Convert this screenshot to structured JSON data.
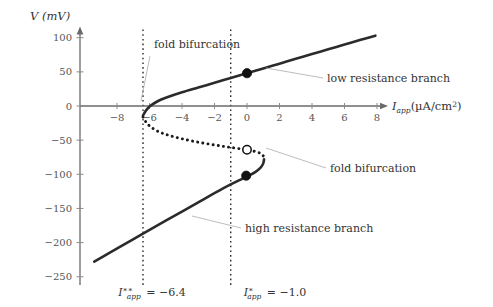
{
  "figure": {
    "kind": "bifurcation-diagram",
    "background": "#ffffff"
  },
  "axes": {
    "y_axis_title": "V (mV)",
    "x_axis_title_main": "I",
    "x_axis_title_sub": "app",
    "x_axis_title_units": "(µA/cm",
    "x_axis_title_units_sup": "2",
    "x_axis_title_units_close": ")",
    "x_ticks": [
      -8,
      -6,
      -4,
      -2,
      0,
      2,
      4,
      6,
      8
    ],
    "x_tick_labels": [
      "−8",
      "−6",
      "−4",
      "−2",
      "0",
      "2",
      "4",
      "6",
      "8"
    ],
    "y_ticks": [
      100,
      50,
      0,
      -50,
      -100,
      -150,
      -200,
      -250
    ],
    "y_tick_labels": [
      "100",
      "50",
      "0",
      "−50",
      "−100",
      "−150",
      "−200",
      "−250"
    ],
    "xlim": [
      -10.2,
      8.9
    ],
    "ylim": [
      -262,
      112
    ],
    "axis_color": "#555555",
    "grid": false
  },
  "annotations": [
    {
      "id": "fold-upper",
      "text": "fold bifurcation",
      "x_px": 154,
      "y_px": 48,
      "leader": [
        [
          150,
          56
        ],
        [
          141,
          101
        ]
      ]
    },
    {
      "id": "low-branch",
      "text": "low resistance branch",
      "x_px": 327,
      "y_px": 82,
      "leader": [
        [
          323,
          78
        ],
        [
          266,
          68
        ]
      ]
    },
    {
      "id": "fold-lower",
      "text": "fold bifurcation",
      "x_px": 330,
      "y_px": 172,
      "leader": [
        [
          326,
          168
        ],
        [
          266,
          148
        ]
      ]
    },
    {
      "id": "high-branch",
      "text": "high resistance branch",
      "x_px": 245,
      "y_px": 232,
      "leader": [
        [
          241,
          228
        ],
        [
          192,
          216
        ]
      ]
    }
  ],
  "parameters": [
    {
      "id": "I-double-star",
      "symbol": "I",
      "sub": "app",
      "sup": "∗∗",
      "equals": "=",
      "value": "−6.4",
      "x_value": -6.4,
      "label_x_px": 152,
      "label_y_px": 296
    },
    {
      "id": "I-star",
      "symbol": "I",
      "sub": "app",
      "sup": "∗",
      "equals": "=",
      "value": "−1.0",
      "x_value": -1.0,
      "label_x_px": 275,
      "label_y_px": 296
    }
  ],
  "chart_data": {
    "type": "line",
    "title": "",
    "xlabel": "I_app (µA/cm^2)",
    "ylabel": "V (mV)",
    "xlim": [
      -10.2,
      8.9
    ],
    "ylim": [
      -262,
      112
    ],
    "grid": false,
    "series": [
      {
        "name": "low resistance branch",
        "style": "solid",
        "linewidth": 2.6,
        "color": "#2b2b2b",
        "description": "stable upper branch, emerges at left fold I=-6.4 and rises to the right",
        "points": [
          [
            -6.4,
            -14
          ],
          [
            -6.2,
            -6
          ],
          [
            -5.9,
            1
          ],
          [
            -5.5,
            7
          ],
          [
            -5.0,
            12
          ],
          [
            -4.0,
            20
          ],
          [
            -3.0,
            27
          ],
          [
            -2.0,
            34
          ],
          [
            -1.0,
            41
          ],
          [
            0.0,
            48
          ],
          [
            1.0,
            55
          ],
          [
            2.0,
            62
          ],
          [
            3.0,
            69
          ],
          [
            4.0,
            76
          ],
          [
            5.0,
            83
          ],
          [
            6.0,
            90
          ],
          [
            7.0,
            97
          ],
          [
            7.9,
            103
          ]
        ]
      },
      {
        "name": "unstable middle branch",
        "style": "dotted",
        "linewidth": 2.6,
        "color": "#1a1a1a",
        "description": "saddle branch connecting the two fold points",
        "points": [
          [
            -6.4,
            -16
          ],
          [
            -6.2,
            -24
          ],
          [
            -5.9,
            -31
          ],
          [
            -5.4,
            -38
          ],
          [
            -4.8,
            -43
          ],
          [
            -4.0,
            -48
          ],
          [
            -3.0,
            -53
          ],
          [
            -2.0,
            -57
          ],
          [
            -1.2,
            -60
          ],
          [
            -0.6,
            -62
          ],
          [
            -0.1,
            -64
          ],
          [
            0.4,
            -66
          ],
          [
            0.8,
            -69
          ],
          [
            1.0,
            -73
          ],
          [
            1.05,
            -78
          ]
        ]
      },
      {
        "name": "high resistance branch",
        "style": "solid",
        "linewidth": 2.6,
        "color": "#2b2b2b",
        "description": "stable lower branch, turns at right fold I=-1.0 region and descends to the left",
        "points": [
          [
            1.05,
            -78
          ],
          [
            1.0,
            -84
          ],
          [
            0.85,
            -90
          ],
          [
            0.55,
            -96
          ],
          [
            0.1,
            -102
          ],
          [
            -0.5,
            -109
          ],
          [
            -1.5,
            -121
          ],
          [
            -3.0,
            -141
          ],
          [
            -5.0,
            -168
          ],
          [
            -6.4,
            -187
          ],
          [
            -7.5,
            -202
          ],
          [
            -8.6,
            -217
          ],
          [
            -9.4,
            -228
          ]
        ]
      }
    ],
    "markers": [
      {
        "id": "stable-node-upper",
        "type": "filled-circle",
        "x": 0.0,
        "y": 48,
        "radius_px": 4.6,
        "fill": "#111111",
        "description": "stable equilibrium on low resistance branch"
      },
      {
        "id": "saddle-middle",
        "type": "open-circle",
        "x": 0.0,
        "y": -64,
        "radius_px": 4.2,
        "fill": "#ffffff",
        "stroke": "#111111",
        "description": "unstable saddle equilibrium"
      },
      {
        "id": "stable-node-lower",
        "type": "filled-circle",
        "x": -0.05,
        "y": -102,
        "radius_px": 4.6,
        "fill": "#111111",
        "description": "stable equilibrium on high resistance branch"
      }
    ],
    "vertical_lines": [
      {
        "id": "vline-I-double-star",
        "x": -6.4,
        "style": "dotted",
        "color": "#111111",
        "y_top": 112,
        "y_bottom": -262
      },
      {
        "id": "vline-I-star",
        "x": -1.0,
        "style": "dotted",
        "color": "#111111",
        "y_top": 112,
        "y_bottom": -262
      }
    ]
  }
}
